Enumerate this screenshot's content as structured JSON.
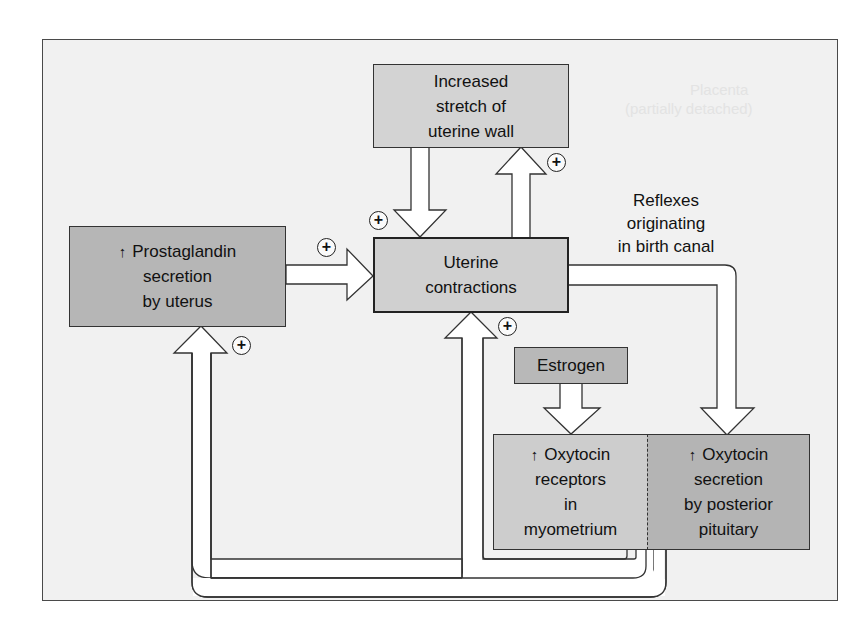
{
  "diagram": {
    "colors": {
      "frame_bg": "#f1f1f1",
      "frame_border": "#4a4a4a",
      "box_light": "#d2d2d2",
      "box_dark": "#b4b4b4",
      "arrow_fill": "#ffffff",
      "text": "#111111"
    },
    "nodes": {
      "stretch": {
        "lines": [
          "Increased",
          "stretch of",
          "uterine wall"
        ]
      },
      "prostaglandin": {
        "prefix_icon": "up-arrow-icon",
        "prefix": "↑",
        "lines": [
          "Prostaglandin",
          "secretion",
          "by uterus"
        ]
      },
      "contractions": {
        "lines": [
          "Uterine",
          "contractions"
        ]
      },
      "estrogen": {
        "lines": [
          "Estrogen"
        ]
      },
      "oxytocin_receptors": {
        "prefix_icon": "up-arrow-icon",
        "prefix": "↑",
        "lines": [
          "Oxytocin",
          "receptors",
          "in",
          "myometrium"
        ]
      },
      "oxytocin_secretion": {
        "prefix_icon": "up-arrow-icon",
        "prefix": "↑",
        "lines": [
          "Oxytocin",
          "secretion",
          "by posterior",
          "pituitary"
        ]
      }
    },
    "labels": {
      "reflexes": [
        "Reflexes",
        "originating",
        "in birth canal"
      ]
    },
    "edges": [
      {
        "from": "stretch",
        "to": "contractions",
        "sign": "+"
      },
      {
        "from": "contractions",
        "to": "stretch",
        "sign": "+"
      },
      {
        "from": "prostaglandin",
        "to": "contractions",
        "sign": "+"
      },
      {
        "from": "contractions",
        "to": "oxytocin_secretion",
        "label": "Reflexes originating in birth canal"
      },
      {
        "from": "estrogen",
        "to": "oxytocin_receptors"
      },
      {
        "from": "oxytocin_receptors",
        "to": "contractions",
        "sign": "+"
      },
      {
        "from": "oxytocin_secretion",
        "to": "prostaglandin",
        "sign": "+"
      }
    ],
    "sign_symbol": "+",
    "ghost_text": [
      "Placenta",
      "(partially detached)"
    ]
  }
}
